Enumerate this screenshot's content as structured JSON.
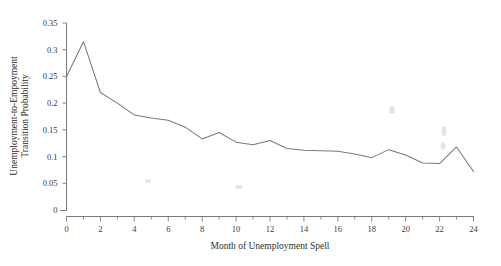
{
  "chart_data": {
    "type": "line",
    "title": "",
    "subtitle": "",
    "xlabel": "Month of Unemployment Spell",
    "ylabel": "Unemployment-to-Empoyment Transition Probability",
    "ylabel_line1": "Unemployment-to-Empoyment",
    "ylabel_line2": "Transition Probability",
    "x": [
      0,
      1,
      2,
      3,
      4,
      5,
      6,
      7,
      8,
      9,
      10,
      11,
      12,
      13,
      14,
      15,
      16,
      17,
      18,
      19,
      20,
      21,
      22,
      23,
      24
    ],
    "values": [
      0.25,
      0.315,
      0.22,
      0.2,
      0.178,
      0.172,
      0.168,
      0.155,
      0.133,
      0.145,
      0.127,
      0.122,
      0.13,
      0.115,
      0.112,
      0.111,
      0.11,
      0.105,
      0.098,
      0.113,
      0.103,
      0.088,
      0.087,
      0.118,
      0.072
    ],
    "series": [
      {
        "name": "Unemployment-to-Employment Transition Probability",
        "values": [
          0.25,
          0.315,
          0.22,
          0.2,
          0.178,
          0.172,
          0.168,
          0.155,
          0.133,
          0.145,
          0.127,
          0.122,
          0.13,
          0.115,
          0.112,
          0.111,
          0.11,
          0.105,
          0.098,
          0.113,
          0.103,
          0.088,
          0.087,
          0.118,
          0.072
        ],
        "color": "#7a7a7a"
      }
    ],
    "xlim": [
      0,
      24
    ],
    "ylim": [
      0,
      0.35
    ],
    "x_major_ticks": [
      0,
      2,
      4,
      6,
      8,
      10,
      12,
      14,
      16,
      18,
      20,
      22,
      24
    ],
    "x_minor_ticks": [
      1,
      3,
      5,
      7,
      9,
      11,
      13,
      15,
      17,
      19,
      21,
      23
    ],
    "x_tick_labels": [
      "0",
      "2",
      "4",
      "6",
      "8",
      "10",
      "12",
      "14",
      "16",
      "18",
      "20",
      "22",
      "24"
    ],
    "y_ticks": [
      0,
      0.05,
      0.1,
      0.15,
      0.2,
      0.25,
      0.3,
      0.35
    ],
    "y_tick_labels": [
      "0",
      "0.05",
      "0.1",
      "0.15",
      "0.2",
      "0.25",
      "0.3",
      "0.35"
    ],
    "grid": false,
    "legend": "none",
    "background_color": "#ffffff",
    "axis_color": "#6b6b6b"
  }
}
